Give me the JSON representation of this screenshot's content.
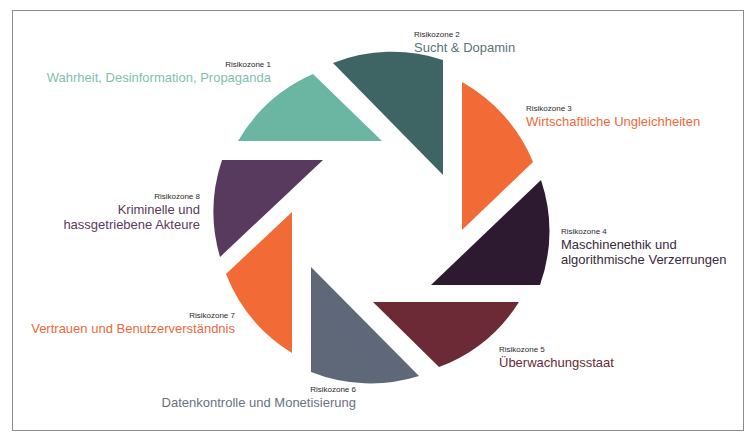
{
  "diagram": {
    "type": "aperture",
    "zones": [
      {
        "id": 1,
        "zone_label": "Risikozone 1",
        "title_lines": [
          "Wahrheit, Desinformation, Propaganda"
        ],
        "color": "#6bb5a3"
      },
      {
        "id": 2,
        "zone_label": "Risikozone 2",
        "title_lines": [
          "Sucht & Dopamin"
        ],
        "color": "#3e6464"
      },
      {
        "id": 3,
        "zone_label": "Risikozone 3",
        "title_lines": [
          "Wirtschaftliche Ungleichheiten"
        ],
        "color": "#f26a36"
      },
      {
        "id": 4,
        "zone_label": "Risikozone 4",
        "title_lines": [
          "Maschinenethik und",
          "algorithmische Verzerrungen"
        ],
        "color": "#2e1a30"
      },
      {
        "id": 5,
        "zone_label": "Risikozone 5",
        "title_lines": [
          "Überwachungsstaat"
        ],
        "color": "#6b2a35"
      },
      {
        "id": 6,
        "zone_label": "Risikozone 6",
        "title_lines": [
          "Datenkontrolle und Monetisierung"
        ],
        "color": "#5f6878"
      },
      {
        "id": 7,
        "zone_label": "Risikozone 7",
        "title_lines": [
          "Vertrauen und Benutzerverständnis"
        ],
        "color": "#f26a36"
      },
      {
        "id": 8,
        "zone_label": "Risikozone 8",
        "title_lines": [
          "Kriminelle und",
          "hassgetriebene Akteure"
        ],
        "color": "#583a5e"
      }
    ],
    "text_colors": {
      "1": "#7fbfb0",
      "2": "#5a7478",
      "3": "#ee6a3c",
      "4": "#3a2a3c",
      "5": "#6b2a35",
      "6": "#6a7280",
      "7": "#ee6a3c",
      "8": "#5a3a60"
    }
  }
}
